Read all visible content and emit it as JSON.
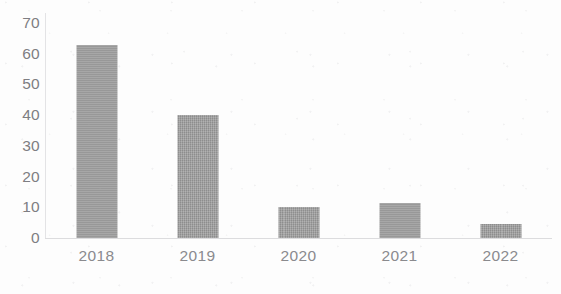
{
  "chart_data": {
    "type": "bar",
    "title": "",
    "subtitle": "",
    "xlabel": "",
    "ylabel": "",
    "categories": [
      "2018",
      "2019",
      "2020",
      "2021",
      "2022"
    ],
    "values": [
      63,
      40,
      10,
      11.5,
      4.5
    ],
    "series": [
      {
        "name": "",
        "values": [
          63,
          40,
          10,
          11.5,
          4.5
        ]
      }
    ],
    "ylim": [
      0,
      70
    ],
    "y_ticks": [
      "70",
      "60",
      "50",
      "40",
      "30",
      "20",
      "10",
      "0"
    ],
    "y_tick_values": [
      70,
      60,
      50,
      40,
      30,
      20,
      10,
      0
    ],
    "grid": false,
    "legend": false,
    "legend_position": "none",
    "annotations": [],
    "colors": {
      "bar_fill": "#9b9b9b",
      "axis_line": "#dcdcde",
      "y_tick_text": "#7e7e82",
      "x_tick_text": "#8a8a8e",
      "background": "#fdfdfd"
    }
  }
}
